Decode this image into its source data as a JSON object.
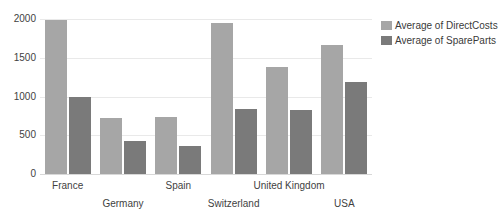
{
  "chart_data": {
    "type": "bar",
    "title": "",
    "subtitle": "",
    "xlabel": "",
    "ylabel": "",
    "grid": true,
    "legend_position": "right",
    "categories": [
      "France",
      "Germany",
      "Spain",
      "Switzerland",
      "United Kingdom",
      "USA"
    ],
    "ytick_labels": [
      "2000",
      "1500",
      "1000",
      "500",
      "0"
    ],
    "yticks": [
      2000,
      1500,
      1000,
      500,
      0
    ],
    "ylim": [
      0,
      2000
    ],
    "colors": {
      "series_0": "#a6a6a6",
      "series_1": "#7a7a7a",
      "gridline": "#e9e9e9",
      "text": "#3a3a3a",
      "background": "#ffffff"
    },
    "series": [
      {
        "name": "Average of DirectCosts",
        "color": "#a6a6a6",
        "values": [
          1990,
          725,
          730,
          1955,
          1385,
          1665
        ]
      },
      {
        "name": "Average of SpareParts",
        "color": "#7a7a7a",
        "values": [
          1000,
          420,
          360,
          845,
          830,
          1185
        ]
      }
    ]
  },
  "legend": {
    "items": [
      {
        "label": "Average of DirectCosts",
        "color": "#a6a6a6"
      },
      {
        "label": "Average of SpareParts",
        "color": "#7a7a7a"
      }
    ]
  }
}
